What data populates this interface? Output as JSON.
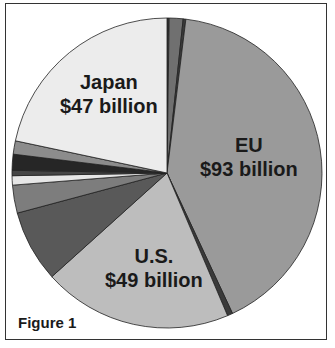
{
  "chart_data": {
    "type": "pie",
    "title": "Figure 1",
    "start_angle_deg": 0,
    "direction": "clockwise",
    "slices": [
      {
        "name": "Other (top 1)",
        "value": 0.5,
        "label": "",
        "color": "#3a3a3a",
        "start": 0,
        "end": 0.8
      },
      {
        "name": "Other (top 2)",
        "value": 3.2,
        "label": "",
        "color": "#707070",
        "start": 0.8,
        "end": 6
      },
      {
        "name": "Other (top 3)",
        "value": 0.6,
        "label": "",
        "color": "#3a3a3a",
        "start": 6,
        "end": 7
      },
      {
        "name": "EU",
        "value": 93,
        "label": "EU\n$93 billion",
        "color": "#9a9a9a",
        "start": 7,
        "end": 155
      },
      {
        "name": "Other (thin dark)",
        "value": 1.2,
        "label": "",
        "color": "#3a3a3a",
        "start": 155,
        "end": 157
      },
      {
        "name": "U.S.",
        "value": 49,
        "label": "U.S.\n$49 billion",
        "color": "#bdbdbd",
        "start": 157,
        "end": 228
      },
      {
        "name": "Other (dark gray)",
        "value": 17,
        "label": "",
        "color": "#595959",
        "start": 228,
        "end": 255
      },
      {
        "name": "Other (medium gray)",
        "value": 6.6,
        "label": "",
        "color": "#7d7d7d",
        "start": 255,
        "end": 265.5
      },
      {
        "name": "Other (white)",
        "value": 2.2,
        "label": "",
        "color": "#e6e6e6",
        "start": 265.5,
        "end": 269
      },
      {
        "name": "Other (dark)",
        "value": 1.3,
        "label": "",
        "color": "#454545",
        "start": 269,
        "end": 271
      },
      {
        "name": "Other (black)",
        "value": 3.8,
        "label": "",
        "color": "#262626",
        "start": 271,
        "end": 277
      },
      {
        "name": "Other (gray)",
        "value": 3.2,
        "label": "",
        "color": "#8c8c8c",
        "start": 277,
        "end": 282
      },
      {
        "name": "Japan",
        "value": 47,
        "label": "Japan\n$47 billion",
        "color": "#ececec",
        "start": 282,
        "end": 360
      }
    ],
    "labels": {
      "eu": {
        "name": "EU",
        "value": "$93 billion"
      },
      "us": {
        "name": "U.S.",
        "value": "$49 billion"
      },
      "japan": {
        "name": "Japan",
        "value": "$47 billion"
      }
    },
    "legend": null
  },
  "figure_label": "Figure 1"
}
